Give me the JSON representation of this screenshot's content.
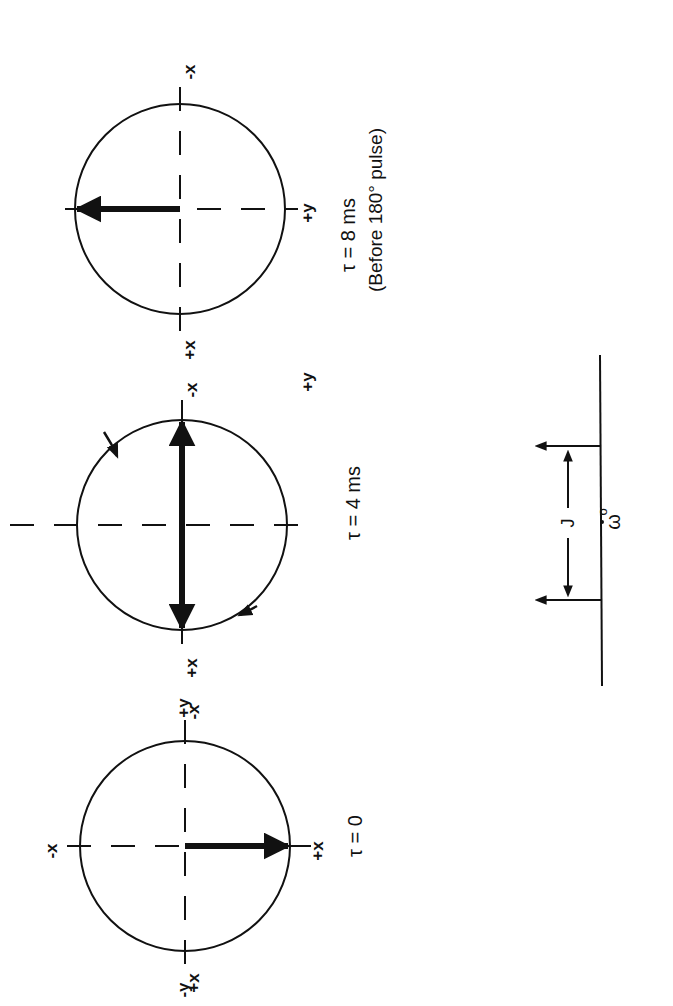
{
  "figure": {
    "orientation": "rotated-90-ccw",
    "colors": {
      "ink": "#111111",
      "background": "#ffffff"
    },
    "axis_labels": {
      "plus_x": "+x",
      "minus_x": "-x",
      "plus_y": "+y",
      "minus_y": "-y"
    },
    "panels": [
      {
        "id": "t0",
        "caption": "τ = 0",
        "vector": "+y",
        "note": ""
      },
      {
        "id": "t4",
        "caption": "τ = 4 ms",
        "vector": "±x (split, precessing)",
        "note": ""
      },
      {
        "id": "t8",
        "caption": "τ = 8 ms",
        "subcaption": "(Before 180° pulse)",
        "vector": "-y"
      }
    ],
    "spectrum": {
      "coupling_label": "J",
      "center_label": "ω",
      "center_subscript": "o",
      "lines": 2
    }
  }
}
